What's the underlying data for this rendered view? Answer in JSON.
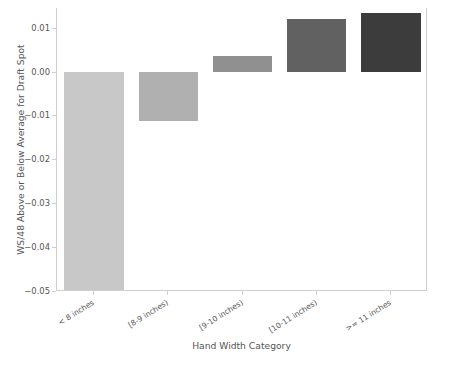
{
  "chart_data": {
    "type": "bar",
    "title": "",
    "xlabel": "Hand Width Category",
    "ylabel": "WS/48 Above or Below Average for Draft Spot",
    "categories": [
      "< 8 inches",
      "[8-9 inches)",
      "[9-10 inches)",
      "[10-11 inches)",
      ">= 11 inches"
    ],
    "values": [
      -0.0497,
      -0.0112,
      0.0036,
      0.0121,
      0.0133
    ],
    "bar_colors": [
      "#c8c8c8",
      "#b0b0b0",
      "#909090",
      "#616161",
      "#3c3c3c"
    ],
    "ylim": [
      -0.05,
      0.0145
    ],
    "yticks": [
      0.01,
      0.0,
      -0.01,
      -0.02,
      -0.03,
      -0.04,
      -0.05
    ],
    "ytick_labels": [
      "0.01",
      "0.00",
      "−0.01",
      "−0.02",
      "−0.03",
      "−0.04",
      "−0.05"
    ],
    "grid": false,
    "legend": "none",
    "background_color": "#ffffff",
    "spine_color": "#cfcfcf",
    "text_color": "#555555"
  }
}
